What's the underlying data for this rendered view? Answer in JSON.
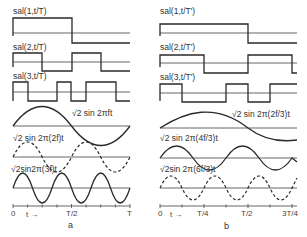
{
  "figure": {
    "panels": [
      {
        "id": "a",
        "caption": "a",
        "labels": {
          "sal1": "sal(1,t/T)",
          "sal2": "sal(2,t/T)",
          "sal3": "sal(3,t/T)",
          "sin1": "√2 sin 2πft",
          "sin2": "√2 sin 2π(2f)t",
          "sin3": "√2sin2π(3f)t"
        },
        "axis_ticks": {
          "t0": "0",
          "tarrow": "t →",
          "tmid": "T/2",
          "tend": "T"
        },
        "sal_transitions": {
          "sal1": [
            0,
            0.5
          ],
          "sal2": [
            0,
            0.25,
            0.5,
            0.75
          ],
          "sal3": [
            0,
            0.125,
            0.375,
            0.5,
            0.625,
            0.875
          ]
        },
        "sine_frequencies": [
          1,
          2,
          3
        ],
        "sine_styles": [
          "solid",
          "dashed",
          "solid"
        ]
      },
      {
        "id": "b",
        "caption": "b",
        "labels": {
          "sal1": "sal(1,t/T')",
          "sal2": "sal(2,t/T')",
          "sal3": "sal(3,t/T')",
          "sin1": "√2 sin 2π(2f/3)t",
          "sin2": "√2 sin 2π(4f/3)t",
          "sin3": "√2sin 2π(6f/3)t"
        },
        "axis_ticks": {
          "t0": "0",
          "tarrow": "t →",
          "tq": "T/4",
          "tmid": "T/2",
          "tend": "3T/4"
        },
        "sine_frequencies": [
          "2f/3",
          "4f/3",
          "6f/3"
        ],
        "sine_styles": [
          "solid",
          "solid",
          "dashed"
        ]
      }
    ]
  }
}
